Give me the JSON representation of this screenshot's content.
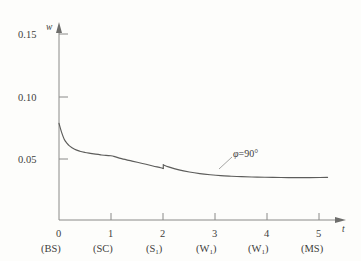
{
  "chart_data": {
    "type": "line",
    "title": "",
    "xlabel": "t",
    "ylabel": "w",
    "xlim": [
      0,
      5.35
    ],
    "ylim": [
      0,
      0.168
    ],
    "grid": false,
    "legend_position": "none",
    "y_ticks": [
      0.05,
      0.1,
      0.15
    ],
    "y_tick_labels": [
      "0.05",
      "0.10",
      "0.15"
    ],
    "x_ticks": [
      0,
      1,
      2,
      3,
      4,
      5
    ],
    "x_tick_labels": [
      "0",
      "1",
      "2",
      "3",
      "4",
      "5"
    ],
    "x_secondary_labels": [
      "(BS)",
      "(SC)",
      "(S1)",
      "(W1)",
      "(W1)",
      "(MS)"
    ],
    "annotations": [
      {
        "text_symbol": "φ",
        "text_rest": "=90°",
        "x": 3.35,
        "y": 0.0495
      }
    ],
    "series": [
      {
        "name": "w(t)",
        "color": "#5d5d5b",
        "discontinuity_at_x": 2,
        "x": [
          0,
          0.05,
          0.1,
          0.15,
          0.2,
          0.3,
          0.4,
          0.5,
          0.6,
          0.7,
          0.8,
          0.9,
          1.0,
          1.05,
          1.2,
          1.4,
          1.6,
          1.8,
          1.95,
          2.0,
          2.0,
          2.1,
          2.3,
          2.5,
          2.7,
          2.9,
          3.1,
          3.3,
          3.5,
          3.8,
          4.1,
          4.4,
          4.7,
          5.0,
          5.15
        ],
        "y": [
          0.0855,
          0.0775,
          0.0715,
          0.068,
          0.0655,
          0.0625,
          0.0608,
          0.0597,
          0.0589,
          0.0582,
          0.0576,
          0.0571,
          0.0568,
          0.0563,
          0.0543,
          0.0521,
          0.05,
          0.0478,
          0.0462,
          0.0455,
          0.0488,
          0.047,
          0.0443,
          0.0424,
          0.041,
          0.04,
          0.0392,
          0.0387,
          0.0383,
          0.0379,
          0.0377,
          0.0375,
          0.0375,
          0.0376,
          0.0377
        ]
      }
    ]
  }
}
